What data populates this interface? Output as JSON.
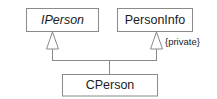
{
  "diagram": {
    "type": "uml-class-diagram",
    "title": "",
    "background_color": "#ffffff",
    "stroke_color": "#8a8a8a",
    "text_color": "#1b1b1b",
    "classes": [
      {
        "id": "iperson",
        "name": "IPerson",
        "stereotype": "interface",
        "font_style": "italic",
        "x": 26,
        "y": 8,
        "width": 72,
        "height": 24
      },
      {
        "id": "personinfo",
        "name": "PersonInfo",
        "stereotype": "class",
        "font_style": "normal",
        "x": 117,
        "y": 8,
        "width": 75,
        "height": 24
      },
      {
        "id": "cperson",
        "name": "CPerson",
        "stereotype": "class",
        "font_style": "normal",
        "x": 62,
        "y": 74,
        "width": 95,
        "height": 22
      }
    ],
    "relationships": [
      {
        "id": "cperson-implements-iperson",
        "type": "generalization",
        "from": "cperson",
        "to": "iperson",
        "arrowhead": "hollow-triangle",
        "label": ""
      },
      {
        "id": "cperson-inherits-personinfo",
        "type": "generalization",
        "from": "cperson",
        "to": "personinfo",
        "arrowhead": "hollow-triangle",
        "label": "{private}"
      }
    ],
    "constraint_label": "{private}"
  }
}
